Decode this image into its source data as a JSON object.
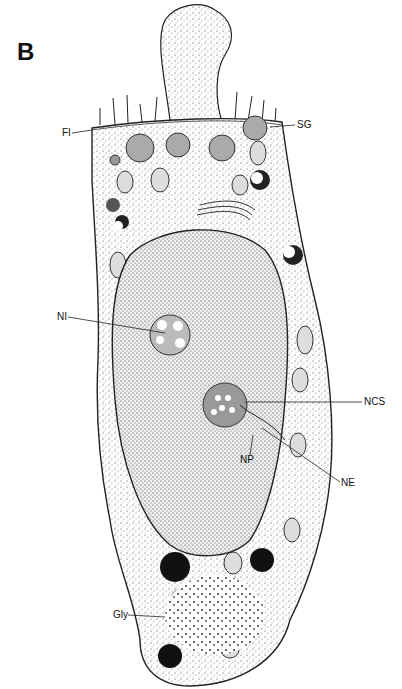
{
  "figure": {
    "panel_label": "B",
    "labels": [
      {
        "id": "fi",
        "text": "FI",
        "x": 62,
        "y": 129,
        "target_x": 90,
        "target_y": 128
      },
      {
        "id": "sg",
        "text": "SG",
        "x": 297,
        "y": 121,
        "target_x": 280,
        "target_y": 126
      },
      {
        "id": "ni",
        "text": "NI",
        "x": 57,
        "y": 313,
        "target_x": 165,
        "target_y": 330
      },
      {
        "id": "ncs",
        "text": "NCS",
        "x": 364,
        "y": 398,
        "target_x": 258,
        "target_y": 403
      },
      {
        "id": "np",
        "text": "NP",
        "x": 240,
        "y": 455,
        "target_x": 253,
        "target_y": 438
      },
      {
        "id": "ne",
        "text": "NE",
        "x": 341,
        "y": 478,
        "target_x": 260,
        "target_y": 425
      },
      {
        "id": "gly",
        "text": "Gly",
        "x": 113,
        "y": 612,
        "target_x": 163,
        "target_y": 615
      }
    ]
  }
}
